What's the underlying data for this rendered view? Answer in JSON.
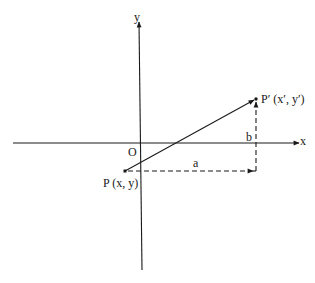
{
  "diagram": {
    "axes": {
      "x_label": "x",
      "y_label": "y",
      "origin_label": "O"
    },
    "points": {
      "P": {
        "label": "P (x, y)"
      },
      "P_prime": {
        "label": "P′ (x′, y′)"
      }
    },
    "components": {
      "horizontal": "a",
      "vertical": "b"
    },
    "colors": {
      "line": "#1a1a1a",
      "background": "#ffffff"
    }
  }
}
